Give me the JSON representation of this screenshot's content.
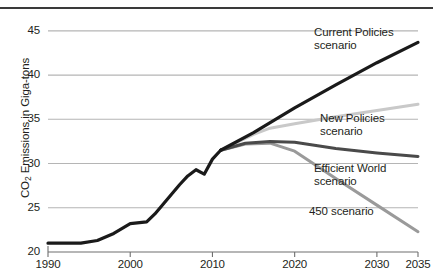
{
  "chart_data": {
    "type": "line",
    "title": "",
    "xlabel": "",
    "ylabel": "CO2 Emissions in Giga-tons",
    "ylabel_prefix": "CO",
    "ylabel_sub": "2",
    "ylabel_suffix": " Emissions in Giga-tons",
    "xlim": [
      1990,
      2035
    ],
    "ylim": [
      20,
      46
    ],
    "grid": "horizontal",
    "legend_position": "inline-right",
    "y_ticks": [
      45,
      40,
      35,
      30,
      25
    ],
    "y_tick_labels": [
      "45",
      "40",
      "35",
      "30",
      "25"
    ],
    "x_ticks": [
      1990,
      2000,
      2010,
      2020,
      2030,
      2035
    ],
    "x_tick_labels": [
      "1990",
      "2000",
      "2010",
      "2020",
      "2030",
      "2035"
    ],
    "colors": {
      "historical": "#1a1a1a",
      "current_policies": "#1a1a1a",
      "new_policies": "#c9c9c9",
      "efficient_world": "#4a4a4a",
      "scenario_450": "#9a9a9a",
      "gridline": "#b5b5b5",
      "axis": "#6e6e6e",
      "top_rule": "#3a3a3a",
      "text": "#231f20"
    },
    "series": [
      {
        "name": "Historical",
        "label": "",
        "color_key": "historical",
        "width": 3.2,
        "x": [
          1990,
          1992,
          1994,
          1996,
          1998,
          2000,
          2002,
          2003,
          2004,
          2005,
          2006,
          2007,
          2008,
          2009,
          2010,
          2011
        ],
        "values": [
          21.0,
          21.0,
          21.0,
          21.3,
          22.1,
          23.2,
          23.4,
          24.3,
          25.4,
          26.5,
          27.6,
          28.6,
          29.3,
          28.8,
          30.5,
          31.5
        ]
      },
      {
        "name": "Current Policies scenario",
        "label": "Current Policies\nscenario",
        "label_line1": "Current Policies",
        "label_line2": "scenario",
        "color_key": "current_policies",
        "width": 3.2,
        "x": [
          2011,
          2015,
          2020,
          2025,
          2030,
          2035
        ],
        "values": [
          31.5,
          33.5,
          36.3,
          38.9,
          41.4,
          43.7
        ]
      },
      {
        "name": "New Policies scenario",
        "label": "New Policies\nscenario",
        "label_line1": "New Policies",
        "label_line2": "scenario",
        "color_key": "new_policies",
        "width": 3.0,
        "x": [
          2011,
          2015,
          2017,
          2020,
          2025,
          2030,
          2035
        ],
        "values": [
          31.5,
          33.3,
          34.0,
          34.5,
          35.3,
          36.0,
          36.7
        ]
      },
      {
        "name": "Efficient World scenario",
        "label": "Efficient World\nscenario",
        "label_line1": "Efficient World",
        "label_line2": "scenario",
        "color_key": "efficient_world",
        "width": 3.0,
        "x": [
          2011,
          2014,
          2017,
          2020,
          2025,
          2030,
          2035
        ],
        "values": [
          31.5,
          32.3,
          32.5,
          32.4,
          31.7,
          31.2,
          30.8
        ]
      },
      {
        "name": "450 scenario",
        "label": "450 scenario",
        "label_line1": "450 scenario",
        "label_line2": "",
        "color_key": "scenario_450",
        "width": 3.0,
        "x": [
          2011,
          2014,
          2017,
          2020,
          2025,
          2030,
          2035
        ],
        "values": [
          31.5,
          32.2,
          32.3,
          31.4,
          28.3,
          25.3,
          22.3
        ]
      }
    ]
  }
}
